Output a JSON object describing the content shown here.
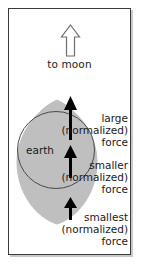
{
  "figure": {
    "frame_border_color": "#3a3a3a",
    "background_color": "#ffffff",
    "earth_fill_color": "#bfbfbf",
    "earth_outline_color": "#4a4a4a",
    "arrow_color": "#000000"
  },
  "moon": {
    "icon": "hollow-up-arrow",
    "label": "to moon"
  },
  "earth": {
    "label": "earth"
  },
  "forces": [
    {
      "id": "large",
      "arrow_icon": "up-arrow",
      "line1": "large",
      "line2": "(normalized)",
      "line3": "force"
    },
    {
      "id": "smaller",
      "arrow_icon": "up-arrow",
      "line1": "smaller",
      "line2": "(normalized)",
      "line3": "force"
    },
    {
      "id": "smallest",
      "arrow_icon": "up-arrow",
      "line1": "smallest",
      "line2": "(normalized)",
      "line3": "force"
    }
  ]
}
